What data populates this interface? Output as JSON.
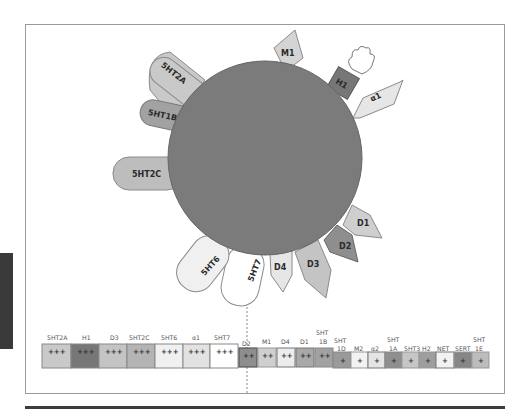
{
  "diagram": {
    "title": "",
    "center": {
      "label": "",
      "color": "#7b7b7b"
    },
    "receptors": [
      {
        "name": "5HT2A",
        "shape": "capsule",
        "color": "#c9c9c9"
      },
      {
        "name": "5HT1B",
        "shape": "capsule",
        "color": "#a2a2a2"
      },
      {
        "name": "5HT2C",
        "shape": "capsule",
        "color": "#bdbdbd"
      },
      {
        "name": "M1",
        "shape": "pentagon",
        "color": "#d4d4d4"
      },
      {
        "name": "H1",
        "shape": "block-with-hand",
        "color": "#777777"
      },
      {
        "name": "α1",
        "shape": "pentagon",
        "color": "#e6e6e6"
      },
      {
        "name": "D1",
        "shape": "pentagon",
        "color": "#cfcfcf"
      },
      {
        "name": "D2",
        "shape": "pentagon",
        "color": "#8e8e8e"
      },
      {
        "name": "D3",
        "shape": "pentagon",
        "color": "#c4c4c4"
      },
      {
        "name": "D4",
        "shape": "pentagon",
        "color": "#e6e6e6"
      },
      {
        "name": "5HT7",
        "shape": "capsule",
        "color": "#ffffff"
      },
      {
        "name": "5HT6",
        "shape": "capsule",
        "color": "#f0f0f0"
      }
    ],
    "affinity_table": {
      "columns": [
        {
          "label": "5HT2A",
          "value": "+++",
          "color": "#c9c9c9"
        },
        {
          "label": "H1",
          "value": "+++",
          "color": "#777777"
        },
        {
          "label": "D3",
          "value": "+++",
          "color": "#c4c4c4"
        },
        {
          "label": "5HT2C",
          "value": "+++",
          "color": "#b4b4b4"
        },
        {
          "label": "5HT6",
          "value": "+++",
          "color": "#f0f0f0"
        },
        {
          "label": "α1",
          "value": "+++",
          "color": "#e2e2e2"
        },
        {
          "label": "5HT7",
          "value": "+++",
          "color": "#ffffff"
        },
        {
          "label": "D2",
          "value": "++",
          "color": "#8e8e8e"
        },
        {
          "label": "M1",
          "value": "++",
          "color": "#cfcfcf"
        },
        {
          "label": "D4",
          "value": "++",
          "color": "#ececec"
        },
        {
          "label": "D1",
          "value": "++",
          "color": "#a8a8a8"
        },
        {
          "label": "5HT 1B",
          "value": "++",
          "color": "#a2a2a2"
        },
        {
          "label": "5HT 1D",
          "value": "+",
          "color": "#9a9a9a"
        },
        {
          "label": "M2",
          "value": "+",
          "color": "#f2f2f2"
        },
        {
          "label": "α2",
          "value": "+",
          "color": "#e4e4e4"
        },
        {
          "label": "5HT 1A",
          "value": "+",
          "color": "#8f8f8f"
        },
        {
          "label": "5HT3",
          "value": "+",
          "color": "#c6c6c6"
        },
        {
          "label": "H2",
          "value": "+",
          "color": "#9e9e9e"
        },
        {
          "label": "NET",
          "value": "+",
          "color": "#f2f2f2"
        },
        {
          "label": "SERT",
          "value": "+",
          "color": "#868686"
        },
        {
          "label": "5HT 1E",
          "value": "+",
          "color": "#bcbcbc"
        }
      ]
    }
  }
}
